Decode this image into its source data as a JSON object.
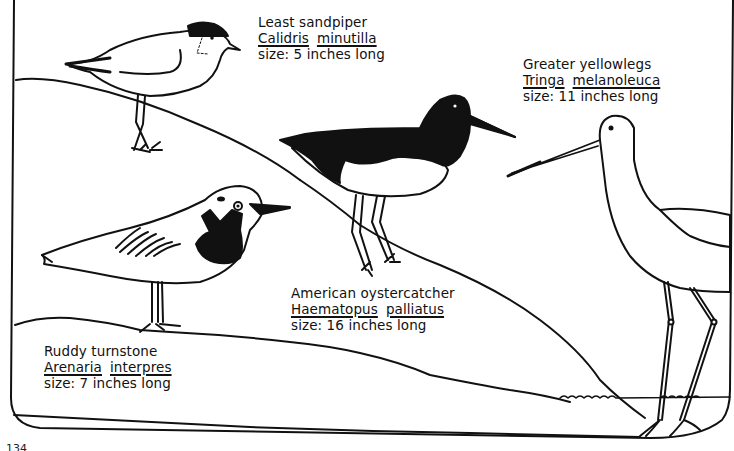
{
  "figure": {
    "page_number": "134"
  },
  "birds": [
    {
      "id": "least-sandpiper",
      "common_name": "Least sandpiper",
      "genus": "Calidris",
      "species": "minutilla",
      "size_text": "size: 5 inches long",
      "size_inches": 5
    },
    {
      "id": "greater-yellowlegs",
      "common_name": "Greater yellowlegs",
      "genus": "Tringa",
      "species": "melanoleuca",
      "size_text": "size: 11 inches long",
      "size_inches": 11
    },
    {
      "id": "american-oystercatcher",
      "common_name": "American oystercatcher",
      "genus": "Haematopus",
      "species": "palliatus",
      "size_text": "size: 16 inches long",
      "size_inches": 16
    },
    {
      "id": "ruddy-turnstone",
      "common_name": "Ruddy turnstone",
      "genus": "Arenaria",
      "species": "interpres",
      "size_text": "size: 7 inches long",
      "size_inches": 7
    }
  ],
  "colors": {
    "ink": "#111111",
    "paper": "#ffffff"
  }
}
